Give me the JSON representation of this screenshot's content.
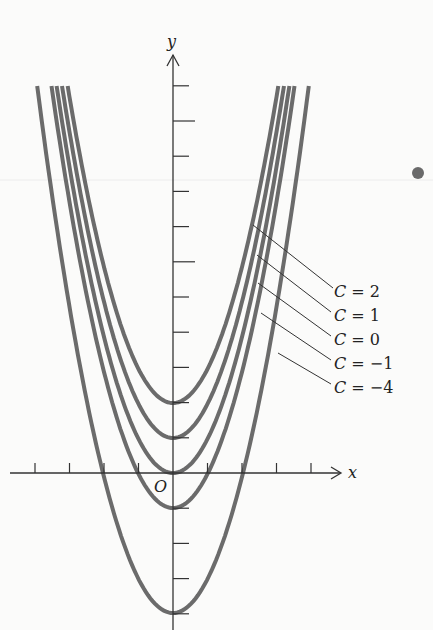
{
  "chart_data": {
    "type": "line",
    "title": "",
    "xlabel": "x",
    "ylabel": "y",
    "origin_label": "O",
    "equation": "y = x^2 + C",
    "xlim": [
      -4.8,
      4.8
    ],
    "ylim": [
      -4.5,
      11
    ],
    "x_ticks": [
      -4,
      -3,
      -2,
      -1,
      1,
      2,
      3,
      4
    ],
    "y_ticks": [
      -4,
      -3,
      -2,
      -1,
      1,
      2,
      3,
      4,
      5,
      6,
      7,
      8,
      9,
      10,
      11
    ],
    "grid": false,
    "series": [
      {
        "name": "C = 2",
        "C": 2,
        "vertex": [
          0,
          2
        ]
      },
      {
        "name": "C = 1",
        "C": 1,
        "vertex": [
          0,
          1
        ]
      },
      {
        "name": "C = 0",
        "C": 0,
        "vertex": [
          0,
          0
        ]
      },
      {
        "name": "C = −1",
        "C": -1,
        "vertex": [
          0,
          -1
        ]
      },
      {
        "name": "C = −4",
        "C": -4,
        "vertex": [
          0,
          -4
        ]
      }
    ],
    "annotations": [
      "C = 2",
      "C = 1",
      "C = 0",
      "C = −1",
      "C = −4"
    ],
    "curve_color": "#6b6b6b",
    "axis_color": "#333333"
  },
  "labels": {
    "x_axis": "x",
    "y_axis": "y",
    "origin": "O",
    "c2": {
      "var": "C",
      "eq": " = 2"
    },
    "c1": {
      "var": "C",
      "eq": " = 1"
    },
    "c0": {
      "var": "C",
      "eq": " = 0"
    },
    "cm1": {
      "var": "C",
      "eq": " = −1"
    },
    "cm4": {
      "var": "C",
      "eq": " = −4"
    }
  }
}
